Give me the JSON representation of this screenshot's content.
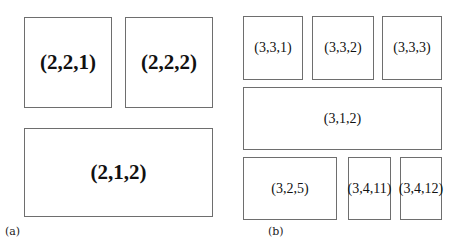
{
  "panels": {
    "a": {
      "caption": "(a)",
      "subplots": [
        {
          "label": "(2,2,1)"
        },
        {
          "label": "(2,2,2)"
        },
        {
          "label": "(2,1,2)"
        }
      ]
    },
    "b": {
      "caption": "(b)",
      "subplots": [
        {
          "label": "(3,3,1)"
        },
        {
          "label": "(3,3,2)"
        },
        {
          "label": "(3,3,3)"
        },
        {
          "label": "(3,1,2)"
        },
        {
          "label": "(3,2,5)"
        },
        {
          "label": "(3,4,11)"
        },
        {
          "label": "(3,4,12)"
        }
      ]
    }
  }
}
